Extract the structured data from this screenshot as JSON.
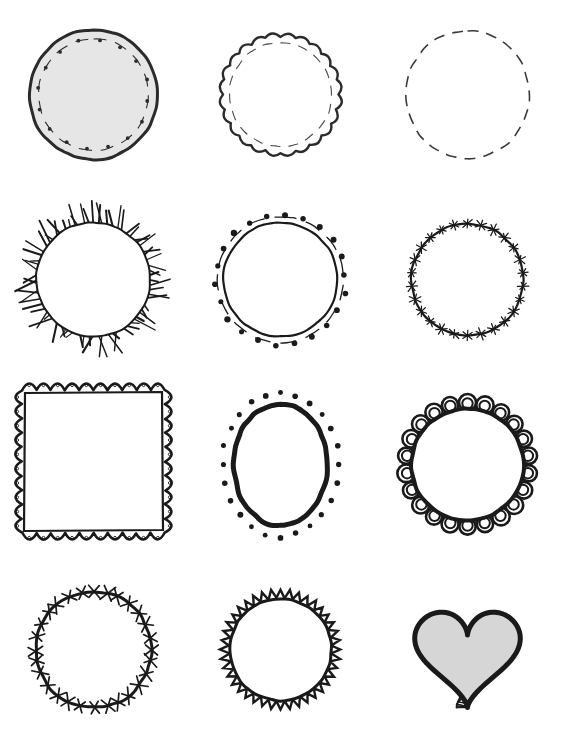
{
  "sheet": {
    "title": "Hand-drawn Doodle Frames",
    "canvas_width": 561,
    "canvas_height": 740,
    "background_color": "#ffffff",
    "ink_color": "#1a1a1a",
    "grid_columns": 3,
    "grid_rows": 4,
    "cell_width": 187,
    "cell_height": 185
  },
  "palette": {
    "ink": "#1a1a1a",
    "ink_soft": "#2b2b2b",
    "fill_light_gray": "#e6e6e6",
    "fill_gray": "#d6d6d6",
    "white": "#ffffff"
  },
  "frames": [
    {
      "index": 1,
      "name": "filled-circle-dashed-dots-frame",
      "shape": "circle",
      "label": "Filled circle with dashed inner ring and dots",
      "border_style": "solid-outline",
      "fill": "#e6e6e6",
      "stroke": "#2b2b2b",
      "stroke_width": 3,
      "decoration": "dashed-ring-with-dots",
      "dot_count": 16
    },
    {
      "index": 2,
      "name": "scalloped-circle-dashed-frame",
      "shape": "circle",
      "label": "Scalloped circle with dashed inner circle",
      "border_style": "scallop",
      "fill": "#ffffff",
      "stroke": "#2b2b2b",
      "stroke_width": 2.4,
      "decoration": "inner-dashed-circle",
      "scallop_count": 24
    },
    {
      "index": 3,
      "name": "dashed-circle-frame",
      "shape": "circle",
      "label": "Simple dashed circle",
      "border_style": "dashed",
      "fill": "#ffffff",
      "stroke": "#3a3a3a",
      "stroke_width": 1.6,
      "decoration": "none",
      "dash_count": 40
    },
    {
      "index": 4,
      "name": "sunburst-spiky-circle-frame",
      "shape": "circle",
      "label": "Circle with radiating spiky rays",
      "border_style": "solid-outline",
      "fill": "#ffffff",
      "stroke": "#1a1a1a",
      "stroke_width": 2,
      "decoration": "radiating-spikes",
      "spike_count": 72
    },
    {
      "index": 5,
      "name": "circle-dashed-ring-dots-frame",
      "shape": "circle",
      "label": "Circle with outer dashed ring and dots",
      "border_style": "solid-outline",
      "fill": "#ffffff",
      "stroke": "#1a1a1a",
      "stroke_width": 2.2,
      "decoration": "outer-dashed-ring-and-dots",
      "dot_count": 22
    },
    {
      "index": 6,
      "name": "barbed-star-circle-frame",
      "shape": "circle",
      "label": "Circle with star barb marks",
      "border_style": "solid-outline",
      "fill": "#ffffff",
      "stroke": "#1a1a1a",
      "stroke_width": 2.2,
      "decoration": "star-barbs",
      "barb_count": 26
    },
    {
      "index": 7,
      "name": "scalloped-square-lace-frame",
      "shape": "square",
      "label": "Square frame with scalloped lace border and dots",
      "border_style": "scallop-lace",
      "fill": "#ffffff",
      "stroke": "#1a1a1a",
      "stroke_width": 2.6,
      "decoration": "scallops-with-dots",
      "scallop_count": 36
    },
    {
      "index": 8,
      "name": "oval-with-dots-frame",
      "shape": "oval",
      "label": "Bold oval surrounded by dots",
      "border_style": "thick-outline",
      "fill": "#ffffff",
      "stroke": "#1a1a1a",
      "stroke_width": 5,
      "decoration": "surrounding-dots",
      "dot_count": 24
    },
    {
      "index": 9,
      "name": "bold-scalloped-circle-frame",
      "shape": "circle",
      "label": "Circle with bold doubled scalloped lace border",
      "border_style": "double-scallop",
      "fill": "#ffffff",
      "stroke": "#1a1a1a",
      "stroke_width": 4,
      "decoration": "double-scallop-petals",
      "scallop_count": 22
    },
    {
      "index": 10,
      "name": "barbed-wire-circle-frame",
      "shape": "circle",
      "label": "Barbed wire circle with cross ticks",
      "border_style": "solid-outline",
      "fill": "#ffffff",
      "stroke": "#1a1a1a",
      "stroke_width": 3,
      "decoration": "cross-tick-barbs",
      "barb_count": 28
    },
    {
      "index": 11,
      "name": "zigzag-sawtooth-circle-frame",
      "shape": "circle",
      "label": "Circle with sawtooth zigzag outer edge",
      "border_style": "sawtooth",
      "fill": "#ffffff",
      "stroke": "#1a1a1a",
      "stroke_width": 3,
      "decoration": "inner-solid-circle",
      "tooth_count": 40
    },
    {
      "index": 12,
      "name": "gray-heart-ladder-border-frame",
      "shape": "heart",
      "label": "Gray filled heart with ladder stitch border",
      "border_style": "ladder-stitch",
      "fill": "#d6d6d6",
      "stroke": "#1a1a1a",
      "stroke_width": 5,
      "decoration": "ladder-rungs",
      "rung_count": 46
    }
  ]
}
